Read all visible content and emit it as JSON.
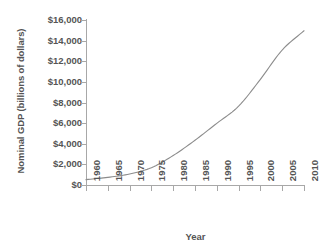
{
  "chart_data": {
    "type": "line",
    "title": "",
    "xlabel": "Year",
    "ylabel": "Nominal GDP (billions of dollars)",
    "xlim": [
      1960,
      2010
    ],
    "ylim": [
      0,
      16000
    ],
    "xticks": [
      "1960",
      "1965",
      "1970",
      "1975",
      "1980",
      "1985",
      "1990",
      "1995",
      "2000",
      "2005",
      "2010"
    ],
    "yticks": [
      "$0",
      "$2,000",
      "$4,000",
      "$6,000",
      "$8,000",
      "$10,000",
      "$12,000",
      "$14,000",
      "$16,000"
    ],
    "ytick_values": [
      0,
      2000,
      4000,
      6000,
      8000,
      10000,
      12000,
      14000,
      16000
    ],
    "grid": false,
    "legend": "none",
    "line_color": "#8c8c8c",
    "axis_color": "#a8a8a8",
    "text_color": "#555555",
    "background": "#ffffff",
    "series": [
      {
        "name": "Nominal GDP",
        "x": [
          1960,
          1965,
          1970,
          1975,
          1980,
          1985,
          1990,
          1995,
          2000,
          2005,
          2010
        ],
        "values": [
          520,
          740,
          1070,
          1680,
          2860,
          4340,
          5980,
          7640,
          10250,
          13090,
          14960
        ]
      }
    ]
  }
}
